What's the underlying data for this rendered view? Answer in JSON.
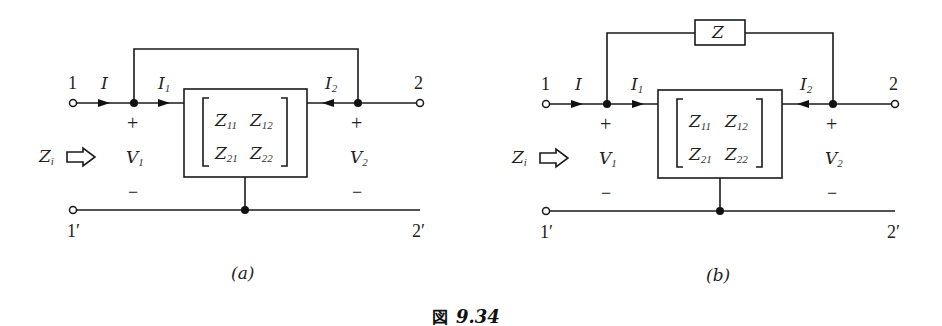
{
  "figure": {
    "caption_prefix": "図",
    "caption_number": "9.34"
  },
  "diagrams": [
    {
      "id": "a",
      "label": "(a)",
      "feedback_element": "wire",
      "terminals": {
        "port1_top": "1",
        "port1_bottom": "1′",
        "port2_top": "2",
        "port2_bottom": "2′"
      },
      "currents": {
        "input": "I",
        "i1": "I",
        "i1_sub": "1",
        "i2": "I",
        "i2_sub": "2"
      },
      "voltages": {
        "v1": "V",
        "v1_sub": "1",
        "v2": "V",
        "v2_sub": "2",
        "plus": "+",
        "minus": "−"
      },
      "impedance_label": {
        "main": "Z",
        "sub": "i"
      },
      "matrix": {
        "z11": {
          "main": "Z",
          "sub": "11"
        },
        "z12": {
          "main": "Z",
          "sub": "12"
        },
        "z21": {
          "main": "Z",
          "sub": "21"
        },
        "z22": {
          "main": "Z",
          "sub": "22"
        }
      }
    },
    {
      "id": "b",
      "label": "(b)",
      "feedback_element": "impedance",
      "feedback_label": "Z",
      "terminals": {
        "port1_top": "1",
        "port1_bottom": "1′",
        "port2_top": "2",
        "port2_bottom": "2′"
      },
      "currents": {
        "input": "I",
        "i1": "I",
        "i1_sub": "1",
        "i2": "I",
        "i2_sub": "2"
      },
      "voltages": {
        "v1": "V",
        "v1_sub": "1",
        "v2": "V",
        "v2_sub": "2",
        "plus": "+",
        "minus": "−"
      },
      "impedance_label": {
        "main": "Z",
        "sub": "i"
      },
      "matrix": {
        "z11": {
          "main": "Z",
          "sub": "11"
        },
        "z12": {
          "main": "Z",
          "sub": "12"
        },
        "z21": {
          "main": "Z",
          "sub": "21"
        },
        "z22": {
          "main": "Z",
          "sub": "22"
        }
      }
    }
  ]
}
